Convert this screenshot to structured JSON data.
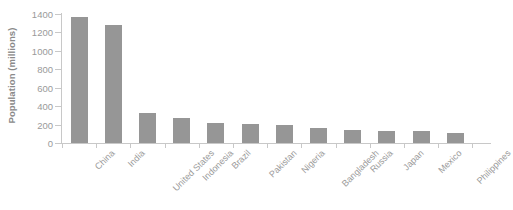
{
  "chart_data": {
    "type": "bar",
    "title": "",
    "xlabel": "",
    "ylabel": "Population (millions)",
    "categories": [
      "China",
      "India",
      "United States",
      "Indonesia",
      "Brazil",
      "Pakistan",
      "Nigeria",
      "Bangladesh",
      "Russia",
      "Japan",
      "Mexico",
      "Philippines"
    ],
    "values": [
      1370,
      1280,
      330,
      270,
      213,
      205,
      200,
      165,
      145,
      126,
      125,
      110
    ],
    "ylim": [
      0,
      1400
    ],
    "ytick_labels": [
      "1400",
      "1200",
      "1000",
      "800",
      "600",
      "400",
      "200",
      "0"
    ],
    "ytick_values": [
      1400,
      1200,
      1000,
      800,
      600,
      400,
      200,
      0
    ],
    "grid": false,
    "legend": "none",
    "bar_color": "#969696",
    "axis_color": "#c8c8c8",
    "text_color": "#9a9a9a",
    "background": "#ffffff"
  }
}
